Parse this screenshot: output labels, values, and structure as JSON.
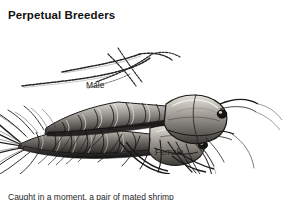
{
  "page": {
    "background_color": "#ffffff",
    "heading": "Perpetual Breeders",
    "body_text": "Caught in a moment, a pair of mated shrimp",
    "caption_truncated": true
  },
  "figure": {
    "name": "mating-shrimp-illustration",
    "style": "pen-and-ink grayscale scientific illustration",
    "ink_color": "#1b1b1b",
    "shade_color": "#6e6e6e",
    "highlight_color": "#d9d9d9",
    "labels": [
      {
        "id": "male",
        "text": "Male",
        "x": 86,
        "y": 80
      },
      {
        "id": "female",
        "text": "Female",
        "x": 155,
        "y": 147
      }
    ],
    "features": [
      "long segmented antennae crossing at upper left",
      "segmented carapace and abdomen of male",
      "larger female body below male",
      "feathery tail fan and antennules at lower left",
      "walking legs and pleopods",
      "long whip antenna curving to lower right",
      "stalked compound eyes"
    ]
  }
}
